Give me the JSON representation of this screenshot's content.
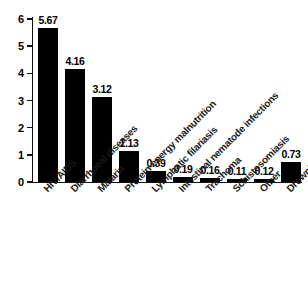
{
  "chart_data": {
    "type": "bar",
    "title": "",
    "subtitle": "",
    "xlabel": "",
    "ylabel": "",
    "ylim": [
      0,
      6
    ],
    "yticks": [
      "0",
      "1",
      "2",
      "3",
      "4",
      "5",
      "6"
    ],
    "grid": false,
    "legend": false,
    "bar_color": "#000000",
    "background_color": "#ffffff",
    "axis_color": "#111111",
    "categories": [
      "HIV/AIDS",
      "Diarrhoeal diseases",
      "Malaria",
      "Protein-energy malnutrition",
      "Lymphatic filariasis",
      "Intestinal nematode infections",
      "Trachoma",
      "Schistosomiasis",
      "Other",
      "Drownings"
    ],
    "values": [
      5.67,
      4.16,
      3.12,
      1.13,
      0.39,
      0.19,
      0.16,
      0.11,
      0.12,
      0.73
    ],
    "value_labels": [
      "5.67",
      "4.16",
      "3.12",
      "1.13",
      "0.39",
      "0.19",
      "0.16",
      "0.11",
      "0.12",
      "0.73"
    ]
  }
}
